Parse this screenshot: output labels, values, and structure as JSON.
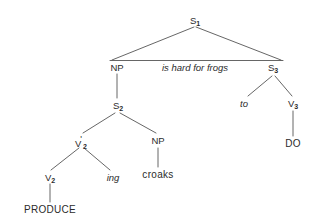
{
  "diagram": {
    "type": "syntactic-tree",
    "title": "",
    "stroke_color": "#555555",
    "text_color": "#2b2b2b",
    "background": "#ffffff",
    "nodes": {
      "s1": {
        "base": "S",
        "subscript": "1",
        "prime": "",
        "text": "S1"
      },
      "np_subject": {
        "base": "NP",
        "subscript": "",
        "prime": "",
        "text": "NP"
      },
      "predicate_phrase": {
        "text": "is hard for frogs",
        "style": "italic"
      },
      "s3": {
        "base": "S",
        "subscript": "3",
        "prime": "",
        "text": "S3"
      },
      "to": {
        "text": "to",
        "style": "italic"
      },
      "v3": {
        "base": "V",
        "subscript": "3",
        "prime": "",
        "text": "V3"
      },
      "do": {
        "text": "DO"
      },
      "s2": {
        "base": "S",
        "subscript": "2",
        "prime": "",
        "text": "S2"
      },
      "v2_bar": {
        "base": "V",
        "subscript": "2",
        "prime": "'",
        "text": "V'2"
      },
      "np_object": {
        "base": "NP",
        "subscript": "",
        "prime": "",
        "text": "NP"
      },
      "v2": {
        "base": "V",
        "subscript": "2",
        "prime": "",
        "text": "V2"
      },
      "ing": {
        "text": "ing",
        "style": "italic"
      },
      "croaks": {
        "text": "croaks"
      },
      "produce": {
        "text": "PRODUCE"
      }
    }
  }
}
